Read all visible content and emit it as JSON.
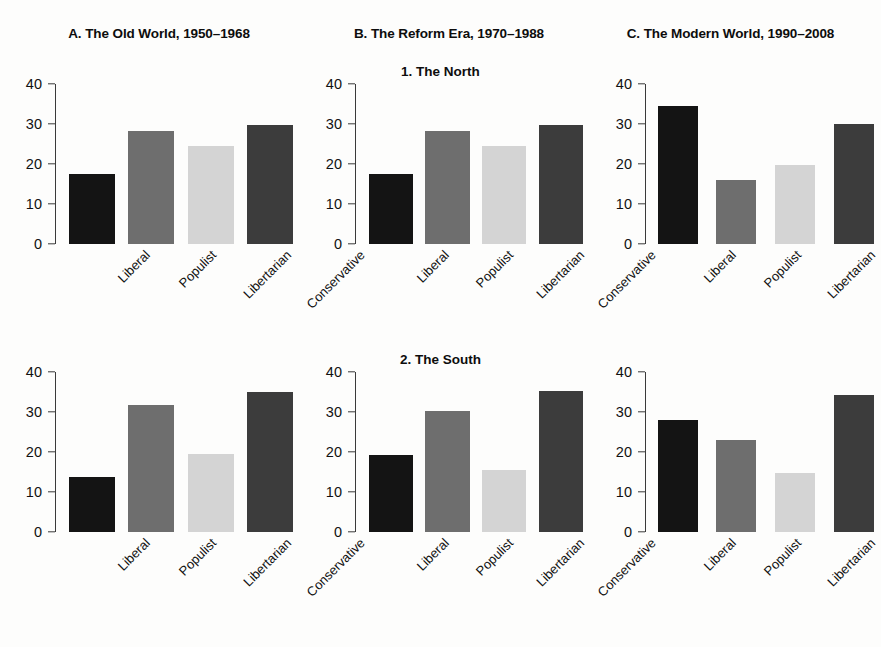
{
  "figure": {
    "row_titles": [
      "1. The North",
      "2. The South"
    ],
    "column_titles": [
      "A. The Old World, 1950–1968",
      "B. The Reform Era, 1970–1988",
      "C. The Modern World, 1990–2008"
    ]
  },
  "chart_data": {
    "type": "bar",
    "title": "",
    "categories": [
      "Liberal",
      "Populist",
      "Libertarian",
      "Conservative"
    ],
    "xlabel": "",
    "ylabel": "",
    "ylim": [
      0,
      40
    ],
    "yticks": [
      0,
      10,
      20,
      30,
      40
    ],
    "ytick_labels": [
      "0",
      "10",
      "20",
      "30",
      "40"
    ],
    "grid": false,
    "legend": "none",
    "bar_colors": [
      "#141414",
      "#6e6e6e",
      "#d4d4d4",
      "#3c3c3c"
    ],
    "panels": [
      {
        "id": "A1",
        "column_title": "A. The Old World, 1950–1968",
        "row_title": "1. The North",
        "values": [
          17.5,
          28.3,
          24.5,
          29.7
        ]
      },
      {
        "id": "B1",
        "column_title": "B. The Reform Era, 1970–1988",
        "row_title": "1. The North",
        "values": [
          17.5,
          28.3,
          24.6,
          29.8
        ]
      },
      {
        "id": "C1",
        "column_title": "C. The Modern World, 1990–2008",
        "row_title": "1. The North",
        "values": [
          34.6,
          16.0,
          19.8,
          30.0
        ]
      },
      {
        "id": "A2",
        "column_title": "A. The Old World, 1950–1968",
        "row_title": "2. The South",
        "values": [
          13.7,
          31.8,
          19.6,
          34.9
        ]
      },
      {
        "id": "B2",
        "column_title": "B. The Reform Era, 1970–1988",
        "row_title": "2. The South",
        "values": [
          19.3,
          30.2,
          15.4,
          35.3
        ]
      },
      {
        "id": "C2",
        "column_title": "C. The Modern World, 1990–2008",
        "row_title": "2. The South",
        "values": [
          28.1,
          23.0,
          14.7,
          34.2
        ]
      }
    ]
  }
}
